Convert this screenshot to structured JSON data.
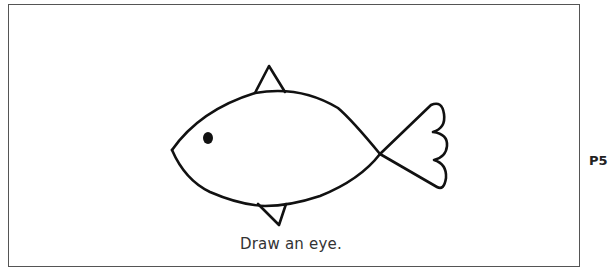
{
  "worksheet": {
    "instruction": "Draw an eye.",
    "page_label": "P5",
    "illustration": "fish-outline"
  },
  "colors": {
    "line": "#111111",
    "border": "#555555",
    "text": "#333333"
  }
}
